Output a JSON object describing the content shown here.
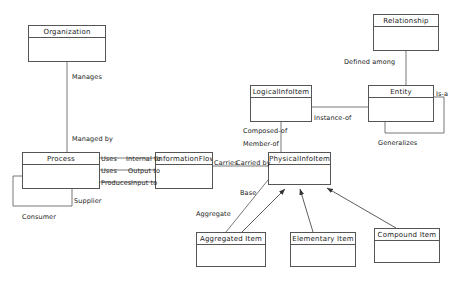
{
  "diagram": {
    "type": "uml-class-diagram",
    "background_color": "#ffffff",
    "line_color": "#555555",
    "text_color": "#1a1a1a",
    "width": 461,
    "height": 286
  },
  "boxes": [
    {
      "id": "organization",
      "label": "Organization",
      "x": 28,
      "y": 25,
      "w": 78,
      "h": 37
    },
    {
      "id": "process",
      "label": "Process",
      "x": 22,
      "y": 152,
      "w": 78,
      "h": 37
    },
    {
      "id": "informationflow",
      "label": "InformationFlow",
      "x": 155,
      "y": 152,
      "w": 58,
      "h": 37
    },
    {
      "id": "logicalinfoitem",
      "label": "LogicalInfoItem",
      "x": 250,
      "y": 85,
      "w": 62,
      "h": 37
    },
    {
      "id": "physicalinfoitem",
      "label": "PhysicalInfoItem",
      "x": 268,
      "y": 152,
      "w": 63,
      "h": 33
    },
    {
      "id": "relationship",
      "label": "Relationship",
      "x": 373,
      "y": 14,
      "w": 66,
      "h": 37
    },
    {
      "id": "entity",
      "label": "Entity",
      "x": 368,
      "y": 85,
      "w": 66,
      "h": 37
    },
    {
      "id": "aggregated_item",
      "label": "Aggregated Item",
      "x": 196,
      "y": 232,
      "w": 70,
      "h": 35
    },
    {
      "id": "elementary_item",
      "label": "Elementary Item",
      "x": 290,
      "y": 232,
      "w": 66,
      "h": 35
    },
    {
      "id": "compound_item",
      "label": "Compound Item",
      "x": 374,
      "y": 228,
      "w": 66,
      "h": 35
    }
  ],
  "edge_labels": [
    {
      "id": "manages",
      "text": "Manages",
      "x": 72,
      "y": 73
    },
    {
      "id": "managed_by",
      "text": "Managed by",
      "x": 72,
      "y": 135
    },
    {
      "id": "uses_1",
      "text": "Uses",
      "x": 101,
      "y": 155
    },
    {
      "id": "internal_to",
      "text": "Internal to",
      "x": 126,
      "y": 155
    },
    {
      "id": "uses_2",
      "text": "Uses",
      "x": 101,
      "y": 167
    },
    {
      "id": "output_to",
      "text": "Output to",
      "x": 128,
      "y": 167
    },
    {
      "id": "produces",
      "text": "Produces",
      "x": 101,
      "y": 179
    },
    {
      "id": "input_to",
      "text": "Input to",
      "x": 131,
      "y": 179
    },
    {
      "id": "supplier",
      "text": "Supplier",
      "x": 74,
      "y": 197
    },
    {
      "id": "consumer",
      "text": "Consumer",
      "x": 22,
      "y": 213
    },
    {
      "id": "carries",
      "text": "Carries",
      "x": 214,
      "y": 159
    },
    {
      "id": "carried_by",
      "text": "Carried by",
      "x": 236,
      "y": 159
    },
    {
      "id": "defined_among",
      "text": "Defined among",
      "x": 344,
      "y": 58
    },
    {
      "id": "is_a",
      "text": "Is-a",
      "x": 436,
      "y": 90
    },
    {
      "id": "generalizes",
      "text": "Generalizes",
      "x": 378,
      "y": 139
    },
    {
      "id": "instance_of",
      "text": "Instance-of",
      "x": 314,
      "y": 114
    },
    {
      "id": "composed_of",
      "text": "Composed-of",
      "x": 243,
      "y": 127
    },
    {
      "id": "member_of",
      "text": "Member-of",
      "x": 243,
      "y": 140
    },
    {
      "id": "base",
      "text": "Base",
      "x": 240,
      "y": 189
    },
    {
      "id": "aggregate",
      "text": "Aggregate",
      "x": 196,
      "y": 210
    }
  ]
}
